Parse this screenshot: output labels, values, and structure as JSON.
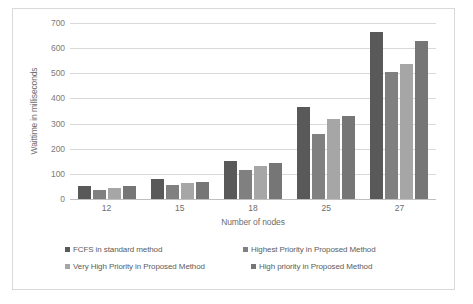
{
  "chart_data": {
    "type": "bar",
    "title": "",
    "xlabel": "Number of nodes",
    "ylabel": "Waittime in milliseconds",
    "categories": [
      "12",
      "15",
      "18",
      "25",
      "27"
    ],
    "series": [
      {
        "name": "FCFS in standard method",
        "color": "#595959",
        "values": [
          50,
          78,
          150,
          367,
          665
        ]
      },
      {
        "name": "Highest Priority in Proposed Method",
        "color": "#808080",
        "values": [
          37,
          55,
          117,
          257,
          505
        ]
      },
      {
        "name": "Very High Priority in Proposed Method",
        "color": "#a6a6a6",
        "values": [
          45,
          62,
          131,
          318,
          537
        ]
      },
      {
        "name": "High priority in Proposed Method",
        "color": "#767676",
        "values": [
          52,
          66,
          145,
          330,
          630
        ]
      }
    ],
    "ylim": [
      0,
      700
    ],
    "yticks": [
      0,
      100,
      200,
      300,
      400,
      500,
      600,
      700
    ],
    "ytick_labels": [
      "0",
      "100",
      "200",
      "300",
      "400",
      "500",
      "600",
      "700"
    ],
    "grid": true,
    "legend_position": "bottom"
  },
  "legend": {
    "rows": [
      [
        {
          "label": "FCFS in standard method",
          "color": "#595959"
        },
        {
          "label": "Highest Priority in Proposed Method",
          "color": "#808080"
        }
      ],
      [
        {
          "label": "Very High Priority in Proposed Method",
          "color": "#a6a6a6"
        },
        {
          "label": "High priority in Proposed Method",
          "color": "#767676"
        }
      ]
    ]
  },
  "colors": {
    "gridline": "#d9d9d9",
    "axis": "#bfbfbf",
    "tick_text": "#6d6d6d",
    "border": "#d9d9d9",
    "background": "#ffffff"
  }
}
